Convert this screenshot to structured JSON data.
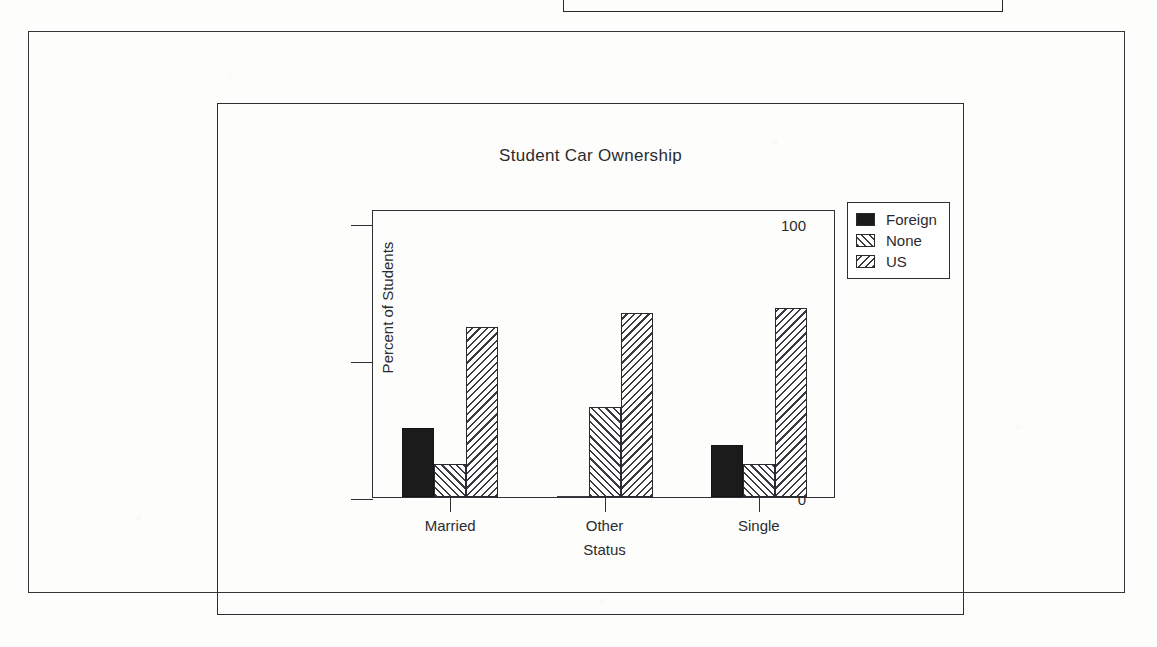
{
  "document": {
    "frames": {
      "top_fragment": "partial-rule",
      "outer_box": "page-border",
      "inner_box": "figure-border"
    }
  },
  "chart_data": {
    "type": "bar",
    "title": "Student Car Ownership",
    "xlabel": "Status",
    "ylabel": "Percent of Students",
    "categories": [
      "Married",
      "Other",
      "Single"
    ],
    "series": [
      {
        "name": "Foreign",
        "fill": "solid",
        "values": [
          25,
          0,
          19
        ]
      },
      {
        "name": "None",
        "fill": "hatch-fwd",
        "values": [
          12,
          33,
          12
        ]
      },
      {
        "name": "US",
        "fill": "hatch-back",
        "values": [
          62,
          67,
          69
        ]
      }
    ],
    "ylim": [
      0,
      105
    ],
    "yticks": [
      0,
      50,
      100
    ],
    "ytick_labels": [
      "0",
      "50",
      "100"
    ],
    "grid": false,
    "legend_position": "top-right-outside",
    "colors": {
      "ink": "#2b2b2f",
      "solid_fill": "#1b1b1b",
      "hatch_line": "#3a3a3f",
      "background": "#ffffff"
    }
  }
}
